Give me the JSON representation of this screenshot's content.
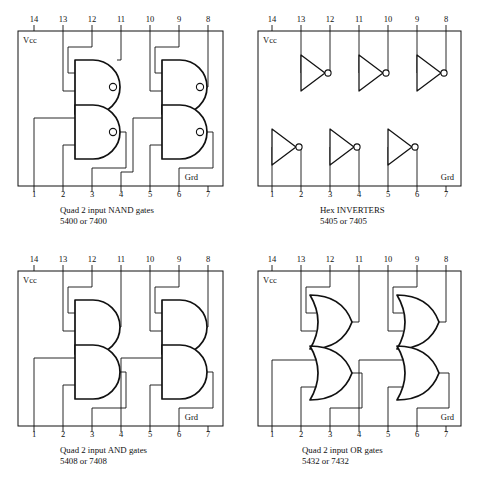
{
  "figure": {
    "background": "#ffffff",
    "ink": "#111111"
  },
  "labels": {
    "vcc": "Vcc",
    "grd": "Grd"
  },
  "pins": {
    "top": [
      "14",
      "13",
      "12",
      "11",
      "10",
      "9",
      "8"
    ],
    "bottom": [
      "1",
      "2",
      "3",
      "4",
      "5",
      "6",
      "7"
    ]
  },
  "panels": [
    {
      "id": "nand",
      "gate_type": "nand",
      "gate_count": 4,
      "caption_line1": "Quad 2 input NAND gates",
      "caption_line2": "5400 or 7400",
      "vcc_pin": "14",
      "grd_pin": "7",
      "gates": [
        {
          "name": "gate-1",
          "inputs": [
            "1",
            "2"
          ],
          "output": "3"
        },
        {
          "name": "gate-2",
          "inputs": [
            "4",
            "5"
          ],
          "output": "6"
        },
        {
          "name": "gate-3",
          "inputs": [
            "13",
            "12"
          ],
          "output": "11"
        },
        {
          "name": "gate-4",
          "inputs": [
            "10",
            "9"
          ],
          "output": "8"
        }
      ]
    },
    {
      "id": "inverter",
      "gate_type": "inverter",
      "gate_count": 6,
      "caption_line1": "Hex INVERTERS",
      "caption_line2": "5405 or 7405",
      "vcc_pin": "14",
      "grd_pin": "7",
      "gates": [
        {
          "name": "inv-1",
          "inputs": [
            "1"
          ],
          "output": "2"
        },
        {
          "name": "inv-2",
          "inputs": [
            "3"
          ],
          "output": "4"
        },
        {
          "name": "inv-3",
          "inputs": [
            "5"
          ],
          "output": "6"
        },
        {
          "name": "inv-4",
          "inputs": [
            "13"
          ],
          "output": "12"
        },
        {
          "name": "inv-5",
          "inputs": [
            "11"
          ],
          "output": "10"
        },
        {
          "name": "inv-6",
          "inputs": [
            "9"
          ],
          "output": "8"
        }
      ]
    },
    {
      "id": "and",
      "gate_type": "and",
      "gate_count": 4,
      "caption_line1": "Quad 2 input AND gates",
      "caption_line2": "5408 or 7408",
      "vcc_pin": "14",
      "grd_pin": "7",
      "gates": [
        {
          "name": "gate-1",
          "inputs": [
            "1",
            "2"
          ],
          "output": "3"
        },
        {
          "name": "gate-2",
          "inputs": [
            "4",
            "5"
          ],
          "output": "6"
        },
        {
          "name": "gate-3",
          "inputs": [
            "13",
            "12"
          ],
          "output": "11"
        },
        {
          "name": "gate-4",
          "inputs": [
            "10",
            "9"
          ],
          "output": "8"
        }
      ]
    },
    {
      "id": "or",
      "gate_type": "or",
      "gate_count": 4,
      "caption_line1": "Quad 2 input OR gates",
      "caption_line2": "5432 or 7432",
      "vcc_pin": "14",
      "grd_pin": "7",
      "gates": [
        {
          "name": "gate-1",
          "inputs": [
            "1",
            "2"
          ],
          "output": "3"
        },
        {
          "name": "gate-2",
          "inputs": [
            "4",
            "5"
          ],
          "output": "6"
        },
        {
          "name": "gate-3",
          "inputs": [
            "13",
            "12"
          ],
          "output": "11"
        },
        {
          "name": "gate-4",
          "inputs": [
            "10",
            "9"
          ],
          "output": "8"
        }
      ]
    }
  ]
}
